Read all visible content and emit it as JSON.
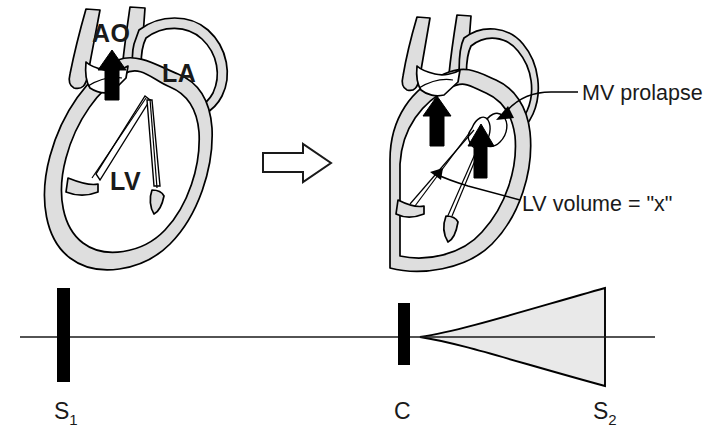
{
  "figure": {
    "background_color": "#ffffff",
    "ink_color": "#000000",
    "myocardium_fill": "#dedede",
    "murmur_fill": "#e9e9e9"
  },
  "panels": {
    "left": {
      "name": "normal-lv-volume-heart",
      "labels": {
        "aorta": "AO",
        "left_atrium": "LA",
        "left_ventricle": "LV"
      },
      "flow_arrow_name": "aortic-outflow-arrow"
    },
    "transition": {
      "name": "transition-arrow",
      "direction": "right",
      "style": "hollow-block-arrow"
    },
    "right": {
      "name": "reduced-lv-volume-heart",
      "callouts": [
        {
          "id": "mv-prolapse",
          "text": "MV prolapse",
          "leader": "curved-arrow-to-mitral-leaflet"
        },
        {
          "id": "lv-volume",
          "text": "LV volume = \"x\"",
          "leader": "straight-arrow-to-lv-cavity"
        }
      ],
      "flow_arrows": [
        "aortic-outflow-arrow",
        "mitral-regurgitation-arrow"
      ]
    }
  },
  "phonocardiogram": {
    "name": "phonocardiogram-trace",
    "baseline_label": "isoelectric-baseline",
    "events": [
      {
        "id": "s1",
        "letter": "S",
        "subscript": "1",
        "kind": "sound-bar",
        "x": 63,
        "amplitude": "large",
        "description": "first heart sound"
      },
      {
        "id": "c",
        "letter": "C",
        "subscript": "",
        "kind": "sound-bar",
        "x": 404,
        "amplitude": "medium",
        "description": "mid-systolic click"
      },
      {
        "id": "s2",
        "letter": "S",
        "subscript": "2",
        "kind": "murmur-end",
        "x": 605,
        "amplitude": "max",
        "description": "second heart sound"
      }
    ],
    "murmur": {
      "id": "late-systolic-murmur",
      "shape": "crescendo",
      "starts_at": "c",
      "ends_at": "s2",
      "peak_half_height": 49
    }
  }
}
